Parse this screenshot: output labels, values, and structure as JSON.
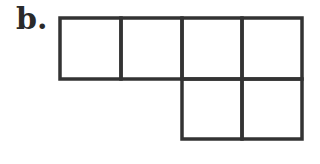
{
  "figure": {
    "label": "b.",
    "stroke_color": "#333333",
    "grid": {
      "cell_size": 61,
      "origin": [
        60,
        18
      ],
      "cells": [
        {
          "row": 0,
          "col": 0
        },
        {
          "row": 0,
          "col": 1
        },
        {
          "row": 0,
          "col": 2
        },
        {
          "row": 0,
          "col": 3
        },
        {
          "row": 1,
          "col": 2
        },
        {
          "row": 1,
          "col": 3
        }
      ]
    }
  }
}
